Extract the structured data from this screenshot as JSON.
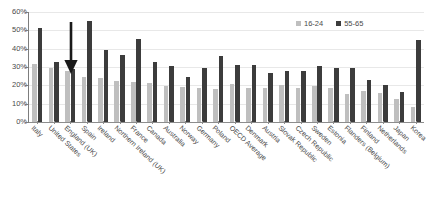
{
  "chart_data": {
    "type": "bar",
    "title": "",
    "xlabel": "",
    "ylabel": "",
    "ylim": [
      0,
      60
    ],
    "ytick_labels": [
      "60%",
      "50%",
      "40%",
      "30%",
      "20%",
      "10%",
      "0%"
    ],
    "ytick_values": [
      60,
      50,
      40,
      30,
      20,
      10,
      0
    ],
    "grid": true,
    "legend_position": "top-right",
    "categories": [
      "Italy",
      "United States",
      "England (UK)",
      "Spain",
      "Ireland",
      "Northern Ireland (UK)",
      "France",
      "Canada",
      "Australia",
      "Norway",
      "Germany",
      "Poland",
      "OECD Average",
      "Denmark",
      "Austria",
      "Slovak Republic",
      "Czech Republic",
      "Sweden",
      "Estonia",
      "Flanders (Belgium)",
      "Finland",
      "Netherlands",
      "Japan",
      "Korea"
    ],
    "series": [
      {
        "name": "16-24",
        "color": "#bfbfbf",
        "values": [
          31.5,
          29.5,
          28.0,
          24.5,
          24.0,
          22.5,
          22.0,
          21.5,
          19.5,
          19.0,
          18.5,
          18.0,
          20.5,
          18.5,
          18.5,
          20.0,
          18.5,
          19.5,
          18.5,
          15.5,
          17.0,
          16.0,
          12.5,
          8.0
        ],
        "unit": "%"
      },
      {
        "name": "55-65",
        "color": "#3c3c3c",
        "values": [
          51.5,
          33.0,
          29.0,
          55.0,
          39.5,
          36.5,
          45.5,
          32.5,
          30.5,
          24.5,
          29.5,
          36.0,
          31.0,
          31.0,
          27.0,
          28.0,
          28.0,
          30.5,
          29.5,
          29.5,
          23.0,
          20.0,
          16.5,
          44.5
        ],
        "unit": "%"
      }
    ],
    "annotations": [
      {
        "name": "arrow",
        "points_at": "England (UK)",
        "direction": "down",
        "color": "#1a1a1a"
      }
    ]
  }
}
